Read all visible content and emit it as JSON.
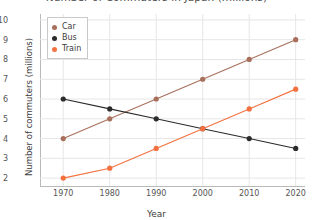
{
  "chart_data": {
    "type": "line",
    "title": "Number of Commuters in Japan (millions)",
    "xlabel": "Year",
    "ylabel": "Number of commuters  (millions)",
    "x": [
      1970,
      1980,
      1990,
      2000,
      2010,
      2020
    ],
    "xticklabels": [
      "1970",
      "1980",
      "1990",
      "2000",
      "2010",
      "2020"
    ],
    "yticks": [
      2,
      3,
      4,
      5,
      6,
      7,
      8,
      9,
      10
    ],
    "yticklabels": [
      "2",
      "3",
      "4",
      "5",
      "6",
      "7",
      "8",
      "9",
      "10"
    ],
    "xlim": [
      1965,
      2022
    ],
    "ylim": [
      1.6,
      10.3
    ],
    "grid": true,
    "legend_position": "upper left",
    "series": [
      {
        "name": "Car",
        "color": "#a8705c",
        "values": [
          4,
          5,
          6,
          7,
          8,
          9
        ]
      },
      {
        "name": "Bus",
        "color": "#2b2b2b",
        "values": [
          6,
          5.5,
          5,
          4.5,
          4,
          3.5
        ]
      },
      {
        "name": "Train",
        "color": "#f4713f",
        "values": [
          2,
          2.5,
          3.5,
          4.5,
          5.5,
          6.5
        ]
      }
    ]
  }
}
